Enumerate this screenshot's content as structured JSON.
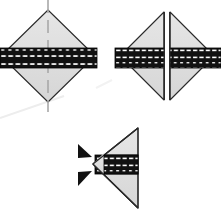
{
  "figure": {
    "background_color": "#ffffff",
    "caption": "",
    "width": 221,
    "height": 224
  },
  "palette": {
    "fill_light": "#dddddd",
    "fill_light_2": "#e3e3e3",
    "outline": "#222222",
    "band_black": "#111111",
    "band_hatch_white": "#ffffff",
    "centerline": "#aaaaaa",
    "artifact_line": "#ededed"
  },
  "panels": [
    {
      "id": "panel-diamond-whole",
      "name": "whole-diamond",
      "label": "",
      "center_x": 48,
      "center_y": 56,
      "half_width": 47,
      "half_height": 46,
      "band": {
        "y_top": 48,
        "y_bottom": 68,
        "x_left": 0,
        "x_right": 97,
        "hatch_count": 26
      },
      "centerline": {
        "x": 48,
        "y_top": 0,
        "y_bottom": 112,
        "dashed": true
      }
    },
    {
      "id": "panel-diamond-split",
      "name": "split-diamond",
      "label": "",
      "left_triangle": {
        "apex_x": 120,
        "apex_y": 56,
        "edge_x": 164,
        "top_y": 12,
        "bottom_y": 100
      },
      "right_triangle": {
        "apex_x": 214,
        "apex_y": 56,
        "edge_x": 170,
        "top_y": 12,
        "bottom_y": 100
      },
      "gap_x": [
        164,
        170
      ],
      "band": {
        "y_top": 48,
        "y_bottom": 68,
        "hatch_count": 13
      }
    },
    {
      "id": "panel-triangle-arrows",
      "name": "left-pointing-triangle",
      "label": "",
      "triangle": {
        "apex_x": 93,
        "apex_y": 164,
        "edge_x": 138,
        "top_y": 128,
        "bottom_y": 208
      },
      "band": {
        "y_top": 156,
        "y_bottom": 174,
        "x_left": 95,
        "x_right": 137,
        "hatch_count": 11
      },
      "arrow_markers": [
        {
          "name": "arrow-marker-upper",
          "x": 78,
          "y": 148,
          "direction": "right"
        },
        {
          "name": "arrow-marker-lower",
          "x": 78,
          "y": 166,
          "direction": "right"
        }
      ]
    }
  ]
}
